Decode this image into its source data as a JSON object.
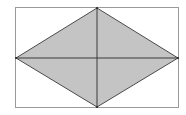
{
  "diagram": {
    "type": "geometry",
    "rectangle": {
      "x": 15,
      "y": 7.5,
      "width": 164,
      "height": 100.5,
      "stroke": "#9a9a9a"
    },
    "rhombus": {
      "vertices": {
        "top": [
          97,
          8
        ],
        "right": [
          178,
          58
        ],
        "bottom": [
          97,
          107
        ],
        "left": [
          16,
          58
        ]
      },
      "fill": "#c4c4c4",
      "stroke": "#4a4a4a"
    },
    "diagonals": [
      {
        "from": [
          97,
          8
        ],
        "to": [
          97,
          107
        ]
      },
      {
        "from": [
          16,
          58
        ],
        "to": [
          178,
          58
        ]
      }
    ],
    "diagonal_color": "#3a3a3a"
  }
}
